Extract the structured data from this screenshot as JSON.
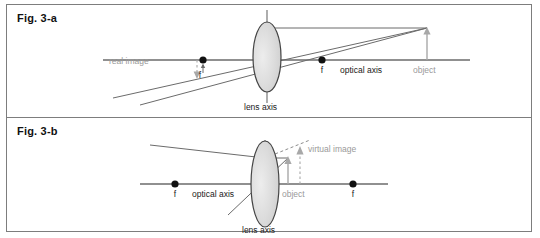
{
  "figure": {
    "border_color": "#7d7d7d",
    "background": "#ffffff",
    "panels": [
      {
        "id": "fig-3-a",
        "title": "Fig. 3-a",
        "labels": {
          "real_image": "real image",
          "focal_left": "f",
          "focal_right": "f",
          "optical_axis": "optical axis",
          "object": "object",
          "lens_axis": "lens axis"
        }
      },
      {
        "id": "fig-3-b",
        "title": "Fig. 3-b",
        "labels": {
          "focal_left": "f",
          "focal_right": "f",
          "optical_axis": "optical axis",
          "object": "object",
          "virtual_image": "virtual image",
          "lens_axis": "lens axis"
        }
      }
    ]
  },
  "colors": {
    "line_dark": "#555555",
    "line_gray": "#9a9a9a",
    "text_dark": "#1a1a1a",
    "text_gray": "#9a9a9a",
    "lens_fill": "#d9d9d9",
    "lens_stroke": "#444444",
    "frame": "#7d7d7d"
  }
}
